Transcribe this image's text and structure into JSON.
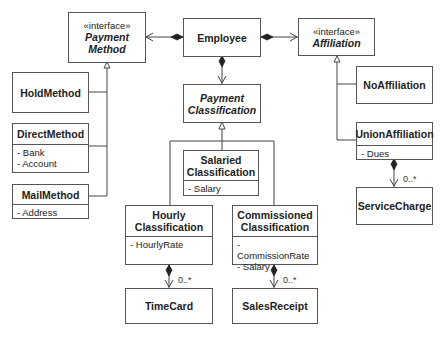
{
  "diagram": {
    "type": "uml-class-diagram",
    "classes": {
      "payment_method": {
        "stereotype": "«interface»",
        "name_line1": "Payment",
        "name_line2": "Method"
      },
      "employee": {
        "name": "Employee"
      },
      "affiliation": {
        "stereotype": "«interface»",
        "name": "Affiliation"
      },
      "hold_method": {
        "name": "HoldMethod"
      },
      "direct_method": {
        "name": "DirectMethod",
        "attributes": [
          "- Bank",
          "- Account"
        ]
      },
      "mail_method": {
        "name": "MailMethod",
        "attributes": [
          "- Address"
        ]
      },
      "payment_classification": {
        "name_line1": "Payment",
        "name_line2": "Classification"
      },
      "salaried_classification": {
        "name_line1": "Salaried",
        "name_line2": "Classification",
        "attributes": [
          "- Salary"
        ]
      },
      "hourly_classification": {
        "name_line1": "Hourly",
        "name_line2": "Classification",
        "attributes": [
          "- HourlyRate"
        ]
      },
      "commissioned_classification": {
        "name_line1": "Commissioned",
        "name_line2": "Classification",
        "attributes": [
          "- CommissionRate",
          "- Salary"
        ]
      },
      "no_affiliation": {
        "name": "NoAffiliation"
      },
      "union_affiliation": {
        "name": "UnionAffiliation",
        "attributes": [
          "- Dues"
        ]
      },
      "service_charge": {
        "name": "ServiceCharge"
      },
      "time_card": {
        "name": "TimeCard"
      },
      "sales_receipt": {
        "name": "SalesReceipt"
      }
    },
    "multiplicities": {
      "time_card": "0..*",
      "sales_receipt": "0..*",
      "service_charge": "0..*"
    },
    "relationships": [
      {
        "from": "Employee",
        "to": "PaymentMethod",
        "kind": "composition"
      },
      {
        "from": "Employee",
        "to": "Affiliation",
        "kind": "composition"
      },
      {
        "from": "Employee",
        "to": "PaymentClassification",
        "kind": "composition"
      },
      {
        "from": "HoldMethod",
        "to": "PaymentMethod",
        "kind": "realization"
      },
      {
        "from": "DirectMethod",
        "to": "PaymentMethod",
        "kind": "realization"
      },
      {
        "from": "MailMethod",
        "to": "PaymentMethod",
        "kind": "realization"
      },
      {
        "from": "SalariedClassification",
        "to": "PaymentClassification",
        "kind": "generalization"
      },
      {
        "from": "HourlyClassification",
        "to": "PaymentClassification",
        "kind": "generalization"
      },
      {
        "from": "CommissionedClassification",
        "to": "PaymentClassification",
        "kind": "generalization"
      },
      {
        "from": "NoAffiliation",
        "to": "Affiliation",
        "kind": "realization"
      },
      {
        "from": "UnionAffiliation",
        "to": "Affiliation",
        "kind": "realization"
      },
      {
        "from": "HourlyClassification",
        "to": "TimeCard",
        "kind": "composition",
        "multiplicity": "0..*"
      },
      {
        "from": "CommissionedClassification",
        "to": "SalesReceipt",
        "kind": "composition",
        "multiplicity": "0..*"
      },
      {
        "from": "UnionAffiliation",
        "to": "ServiceCharge",
        "kind": "composition",
        "multiplicity": "0..*"
      }
    ],
    "colors": {
      "line": "#444444",
      "border": "#555555",
      "background": "#ffffff",
      "text": "#222222"
    }
  }
}
